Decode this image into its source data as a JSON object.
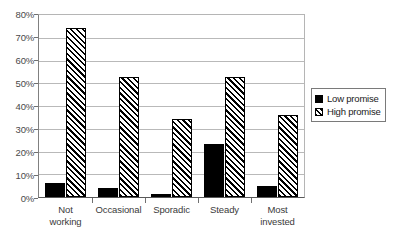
{
  "chart_data": {
    "type": "bar",
    "title": "",
    "xlabel": "",
    "ylabel": "",
    "ylim": [
      0,
      80
    ],
    "ytick_labels": [
      "80%",
      "70%",
      "60%",
      "50%",
      "40%",
      "30%",
      "20%",
      "10%",
      "0%"
    ],
    "ytick_values": [
      80,
      70,
      60,
      50,
      40,
      30,
      20,
      10,
      0
    ],
    "grid": true,
    "legend_position": "right",
    "categories": [
      "Not working",
      "Occasional",
      "Sporadic",
      "Steady",
      "Most invested"
    ],
    "series": [
      {
        "name": "Low promise",
        "fill": "solid-black",
        "color": "#000000",
        "values": [
          6,
          4,
          1.5,
          23,
          5
        ]
      },
      {
        "name": "High promise",
        "fill": "diagonal-hatch",
        "color": "#000000",
        "values": [
          74,
          52.5,
          34,
          52.5,
          36
        ]
      }
    ]
  },
  "axis": {
    "y_labels": [
      "80%",
      "70%",
      "60%",
      "50%",
      "40%",
      "30%",
      "20%",
      "10%",
      "0%"
    ],
    "x_labels": [
      {
        "line1": "Not",
        "line2": "working"
      },
      {
        "line1": "Occasional",
        "line2": ""
      },
      {
        "line1": "Sporadic",
        "line2": ""
      },
      {
        "line1": "Steady",
        "line2": ""
      },
      {
        "line1": "Most",
        "line2": "invested"
      }
    ]
  },
  "legend": {
    "items": [
      {
        "label": "Low promise"
      },
      {
        "label": "High promise"
      }
    ]
  },
  "colors": {
    "bar_low": "#000000",
    "bar_high_outline": "#000000",
    "gridline": "#b9b9b9",
    "axis": "#707070",
    "background": "#ffffff"
  }
}
